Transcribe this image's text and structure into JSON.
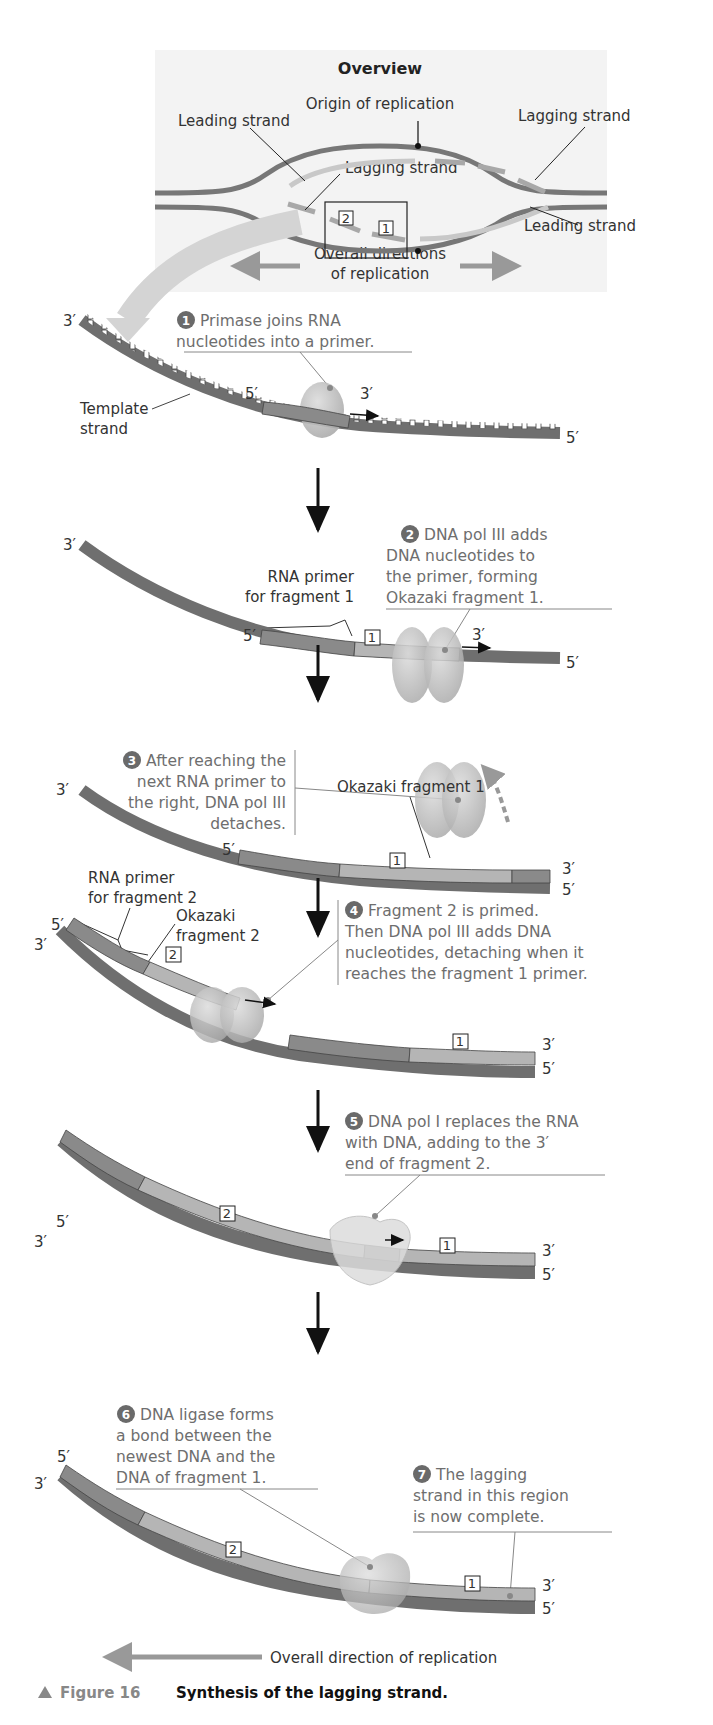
{
  "overview": {
    "title": "Overview",
    "origin_label": "Origin of replication",
    "leading_strand_left": "Leading strand",
    "lagging_strand_right": "Lagging strand",
    "lagging_strand_center": "Lagging strand",
    "leading_strand_right": "Leading strand",
    "directions_line1": "Overall directions",
    "directions_line2": "of replication",
    "box_num_2": "2",
    "box_num_1": "1"
  },
  "steps": [
    {
      "num": "1",
      "lines": [
        "Primase joins RNA",
        "nucleotides into a primer."
      ]
    },
    {
      "num": "2",
      "lines": [
        "DNA pol III adds",
        "DNA nucleotides to",
        "the primer, forming",
        "Okazaki fragment 1."
      ]
    },
    {
      "num": "3",
      "lines": [
        "After reaching the",
        "next RNA primer to",
        "the right, DNA pol III",
        "detaches."
      ]
    },
    {
      "num": "4",
      "lines": [
        "Fragment 2 is primed.",
        "Then DNA pol III adds DNA",
        "nucleotides, detaching when it",
        "reaches the fragment 1 primer."
      ]
    },
    {
      "num": "5",
      "lines": [
        "DNA pol I replaces the RNA",
        "with DNA, adding to the 3′",
        "end of fragment 2."
      ]
    },
    {
      "num": "6",
      "lines": [
        "DNA ligase forms",
        "a bond between the",
        "newest DNA and the",
        "DNA of fragment 1."
      ]
    },
    {
      "num": "7",
      "lines": [
        "The lagging",
        "strand in this region",
        "is now complete."
      ]
    }
  ],
  "labels": {
    "three_prime": "3′",
    "five_prime": "5′",
    "template_line1": "Template",
    "template_line2": "strand",
    "rna_primer_f1_line1": "RNA primer",
    "rna_primer_f1_line2": "for fragment 1",
    "okazaki_f1": "Okazaki fragment 1",
    "rna_primer_f2_line1": "RNA primer",
    "rna_primer_f2_line2": "for fragment 2",
    "okazaki_f2_line1": "Okazaki",
    "okazaki_f2_line2": "fragment 2",
    "frag1": "1",
    "frag2": "2",
    "overall_direction": "Overall direction of replication"
  },
  "caption": {
    "figure_label": "Figure 16",
    "text": "Synthesis of the lagging strand."
  },
  "colors": {
    "template_strand": "#6f6f6f",
    "rna_primer": "#8a8a8a",
    "okazaki_dna": "#b5b5b5",
    "enzyme": "#bdbdbd",
    "overview_bg": "#f3f3f3",
    "step_text": "#6e6e6e",
    "arrow_gray": "#9a9a9a"
  }
}
